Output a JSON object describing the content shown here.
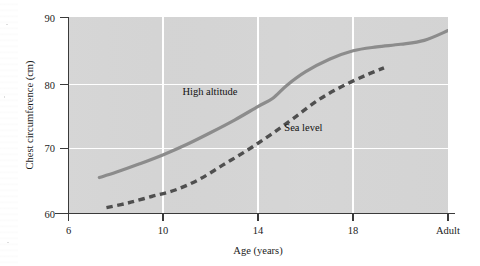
{
  "chart_data": {
    "type": "line",
    "title": "",
    "subtitle": "",
    "xlabel": "Age (years)",
    "ylabel": "Chest circumference (cm)",
    "xlim": [
      6,
      22
    ],
    "ylim": [
      60,
      90
    ],
    "grid": true,
    "grid_color": "#ffffff",
    "plot_background": "#d4d4d4",
    "legend_position": "inline-annotations",
    "x_tick_labels": [
      "6",
      "10",
      "14",
      "18",
      "Adult"
    ],
    "x_tick_values": [
      6,
      10,
      14,
      18,
      22
    ],
    "y_tick_labels": [
      "60",
      "70",
      "80",
      "90"
    ],
    "y_tick_values": [
      60,
      70,
      80,
      90
    ],
    "series": [
      {
        "name": "High altitude",
        "style": "solid",
        "color": "#8c8c8c",
        "x": [
          7.3,
          8.0,
          9.0,
          10.0,
          11.0,
          12.0,
          13.0,
          14.0,
          14.6,
          15.2,
          16.0,
          17.0,
          18.0,
          19.0,
          20.0,
          21.0,
          22.0
        ],
        "y": [
          65.5,
          66.3,
          67.6,
          69.0,
          70.6,
          72.4,
          74.3,
          76.4,
          77.6,
          79.6,
          81.7,
          83.6,
          84.9,
          85.5,
          85.9,
          86.5,
          88.0
        ]
      },
      {
        "name": "Sea level",
        "style": "dashed",
        "color": "#4f4f4f",
        "x": [
          7.6,
          8.5,
          9.5,
          10.5,
          11.5,
          12.5,
          13.5,
          14.5,
          15.5,
          16.5,
          17.5,
          18.5,
          19.3
        ],
        "y": [
          60.9,
          61.6,
          62.6,
          63.6,
          65.2,
          67.4,
          69.6,
          72.0,
          74.6,
          77.3,
          79.4,
          81.1,
          82.3
        ]
      }
    ],
    "annotations": [
      {
        "text": "High altitude",
        "x": 10.8,
        "y": 78.2
      },
      {
        "text": "Sea level",
        "x": 15.1,
        "y": 72.6
      }
    ]
  },
  "figure": {
    "axis_color": "#3a3a3a",
    "text_color": "#1b1b1b"
  }
}
